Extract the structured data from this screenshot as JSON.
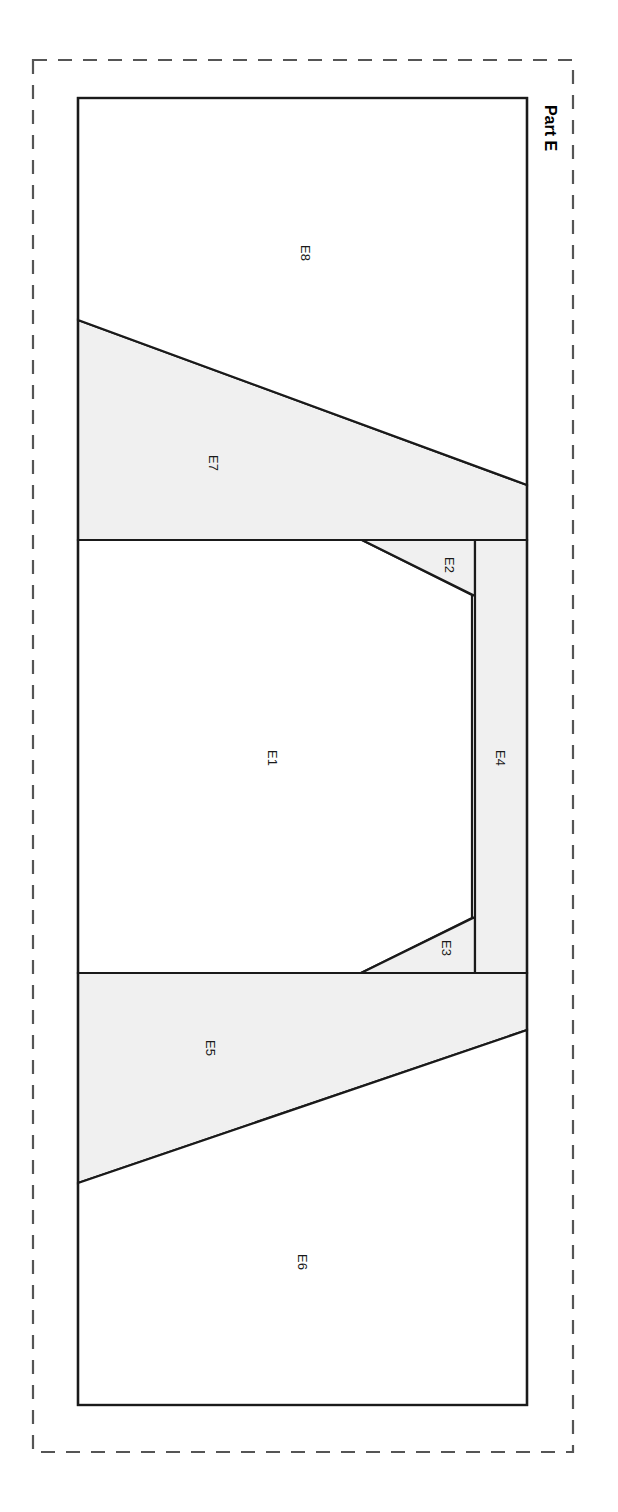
{
  "sheet": {
    "title": "Part E",
    "title_orientation": "rotated-90-clockwise"
  },
  "colors": {
    "shaded_fill": "#f0f0f0",
    "unshaded_fill": "#ffffff",
    "stroke": "#1a1a1a",
    "dashed_border": "#555555",
    "label_text": "#1a1a1a",
    "background": "#ffffff"
  },
  "border": {
    "style": "dashed",
    "x": 33,
    "y": 60,
    "width": 540,
    "height": 1392,
    "dash_pattern": "14 11"
  },
  "outline": {
    "x": 78,
    "y": 98,
    "width": 449,
    "height": 1307
  },
  "regions": [
    {
      "id": "E1",
      "label": "E1",
      "shaded": false,
      "label_x": 272,
      "label_y": 758,
      "points": "78,540 362,540 472,595 472,918 361,973 78,973"
    },
    {
      "id": "E2",
      "label": "E2",
      "shaded": true,
      "label_x": 449,
      "label_y": 565,
      "points": "362,540 475,540 475,596"
    },
    {
      "id": "E3",
      "label": "E3",
      "shaded": true,
      "label_x": 446,
      "label_y": 948,
      "points": "475,917 475,973 361,973"
    },
    {
      "id": "E4",
      "label": "E4",
      "shaded": true,
      "label_x": 500,
      "label_y": 758,
      "points": "475,540 527,540 527,973 475,973"
    },
    {
      "id": "E5",
      "label": "E5",
      "shaded": true,
      "label_x": 210,
      "label_y": 1048,
      "points": "78,973 527,973 527,1030 78,1183"
    },
    {
      "id": "E6",
      "label": "E6",
      "shaded": false,
      "label_x": 302,
      "label_y": 1262,
      "points": "78,1183 527,1030 527,1405 78,1405"
    },
    {
      "id": "E7",
      "label": "E7",
      "shaded": true,
      "label_x": 213,
      "label_y": 463,
      "points": "78,320 527,485 527,540 78,540"
    },
    {
      "id": "E8",
      "label": "E8",
      "shaded": false,
      "label_x": 305,
      "label_y": 253,
      "points": "78,98 527,98 527,485 78,320"
    }
  ],
  "dividers": [
    {
      "id": "divider-upper",
      "x1": 78,
      "y1": 540,
      "x2": 527,
      "y2": 540
    },
    {
      "id": "divider-lower",
      "x1": 78,
      "y1": 973,
      "x2": 527,
      "y2": 973
    }
  ],
  "title_position": {
    "x": 550,
    "y": 128
  }
}
